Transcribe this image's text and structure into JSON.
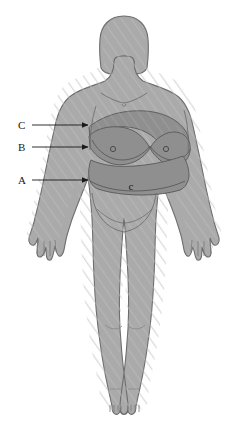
{
  "figure": {
    "alt": "Front-facing silhouette of a female body with three shaded regions labeled A, B and C",
    "background_color": "#ffffff",
    "body_fill": "#aaaaaa",
    "body_stroke": "#6e6e6e",
    "highlight_fill": "#8f8f8f",
    "hatch_color": "#b9b9b9",
    "label_color": "#1a1a1a",
    "arrow_color": "#1a1a1a"
  },
  "callouts": [
    {
      "id": "c",
      "label": "C",
      "label_x": 18,
      "label_y": 129,
      "line_x1": 32,
      "line_x2": 85,
      "line_y": 125,
      "region": "upper-chest-region"
    },
    {
      "id": "b",
      "label": "B",
      "label_x": 18,
      "label_y": 151,
      "line_x1": 32,
      "line_x2": 85,
      "line_y": 147,
      "region": "breast-region"
    },
    {
      "id": "a",
      "label": "A",
      "label_x": 18,
      "label_y": 184,
      "line_x1": 32,
      "line_x2": 85,
      "line_y": 180,
      "region": "upper-abdomen-region"
    }
  ],
  "anatomy_marks": {
    "navel_label": "c",
    "navel_x": 131,
    "navel_y": 187
  }
}
